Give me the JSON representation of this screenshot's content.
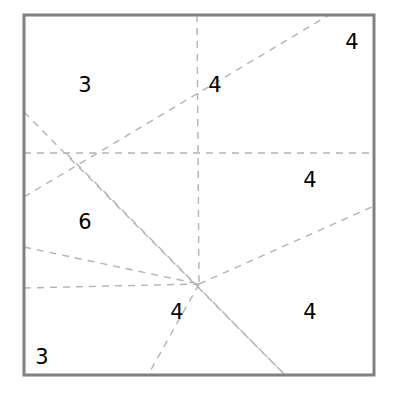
{
  "figure": {
    "canvas": {
      "width": 397,
      "height": 397,
      "background": "#ffffff"
    },
    "square": {
      "name": "bounding-square",
      "x": 24,
      "y": 15,
      "width": 350,
      "height": 360,
      "stroke_color": "#808080",
      "stroke_width": 3,
      "fill": "none"
    },
    "dash_style": {
      "stroke_color": "#b3b3b3",
      "stroke_width": 1.4,
      "dash_pattern": "7 6"
    },
    "vertices": [
      {
        "name": "vertex-left",
        "x": 67,
        "y": 154,
        "degree": 5
      },
      {
        "name": "vertex-lower",
        "x": 199,
        "y": 284,
        "degree": 5
      }
    ],
    "lines": [
      {
        "name": "line-horizontal-mid",
        "x1": 24,
        "y1": 153,
        "x2": 374,
        "y2": 153
      },
      {
        "name": "line-horizontal-lower",
        "x1": 24,
        "y1": 288,
        "x2": 199,
        "y2": 284
      },
      {
        "name": "line-diagonal-up-right",
        "x1": 24,
        "y1": 197,
        "x2": 329,
        "y2": 15
      },
      {
        "name": "line-diagonal-down-right",
        "x1": 24,
        "y1": 112,
        "x2": 285,
        "y2": 375
      },
      {
        "name": "line-vertex-left-to-bottom",
        "x1": 24,
        "y1": 247,
        "x2": 199,
        "y2": 284
      },
      {
        "name": "line-vertex-left-to-lower-bottom",
        "x1": 67,
        "y1": 154,
        "x2": 285,
        "y2": 375
      },
      {
        "name": "line-steep-top-to-vertex",
        "x1": 197,
        "y1": 15,
        "x2": 199,
        "y2": 284
      },
      {
        "name": "line-vertex-to-right-edge",
        "x1": 199,
        "y1": 284,
        "x2": 374,
        "y2": 206
      },
      {
        "name": "line-vertex-to-bottom-left",
        "x1": 199,
        "y1": 284,
        "x2": 148,
        "y2": 375
      }
    ],
    "labels": [
      {
        "name": "region-label-3-upper-left",
        "text": "3",
        "x": 85,
        "y": 85
      },
      {
        "name": "region-label-4-upper-middle",
        "text": "4",
        "x": 215,
        "y": 85
      },
      {
        "name": "region-label-4-upper-right",
        "text": "4",
        "x": 352,
        "y": 42
      },
      {
        "name": "region-label-4-right-middle",
        "text": "4",
        "x": 310,
        "y": 180
      },
      {
        "name": "region-label-6-left-middle",
        "text": "6",
        "x": 85,
        "y": 222
      },
      {
        "name": "region-label-4-bottom-middle",
        "text": "4",
        "x": 177,
        "y": 312
      },
      {
        "name": "region-label-4-bottom-right",
        "text": "4",
        "x": 310,
        "y": 312
      },
      {
        "name": "region-label-3-bottom-left",
        "text": "3",
        "x": 42,
        "y": 357
      }
    ]
  }
}
